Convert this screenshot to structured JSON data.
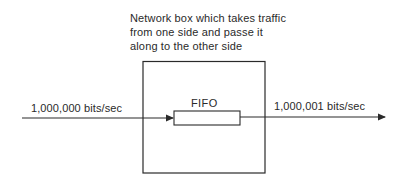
{
  "diagram": {
    "caption": {
      "lines": [
        "Network box which takes traffic",
        "from one side and passe it",
        "along to the other side"
      ]
    },
    "network_box": {
      "label": "Network box"
    },
    "fifo": {
      "label": "FIFO"
    },
    "input": {
      "rate_label": "1,000,000 bits/sec"
    },
    "output": {
      "rate_label": "1,000,001 bits/sec"
    },
    "colors": {
      "stroke": "#2a2a2a",
      "background": "#ffffff",
      "text": "#2a2a2a"
    }
  }
}
